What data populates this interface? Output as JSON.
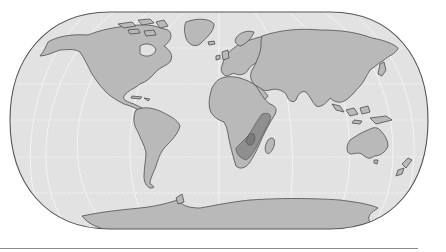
{
  "map": {
    "projection": "pseudocylindrical world map (Eckert-style)",
    "palette": {
      "ocean": "#e2e2e2",
      "land": "#b9b9b9",
      "highlight": "#8f8f8f",
      "highlight_dark": "#7c7c7c",
      "coast": "#4e4e4e",
      "graticule": "#f4f4f4",
      "frame": "#555555"
    },
    "highlighted_region": "Southeastern Africa (East African coast, Mozambique, Zimbabwe region)",
    "continents": [
      "North America",
      "Greenland",
      "South America",
      "Europe",
      "Africa",
      "Asia",
      "Australia",
      "Antarctica"
    ]
  }
}
